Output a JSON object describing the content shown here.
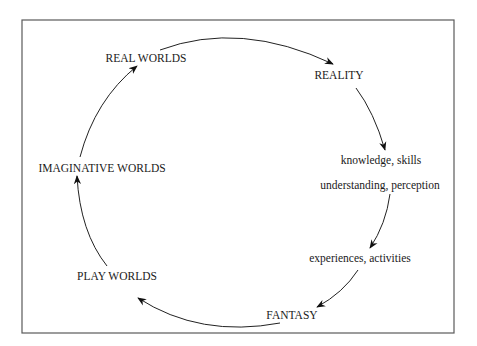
{
  "diagram": {
    "type": "cycle",
    "nodes": [
      {
        "id": "real_worlds",
        "label": "REAL WORLDS"
      },
      {
        "id": "reality",
        "label": "REALITY"
      },
      {
        "id": "knowledge",
        "label": "knowledge, skills"
      },
      {
        "id": "understanding",
        "label": "understanding, perception"
      },
      {
        "id": "experiences",
        "label": "experiences, activities"
      },
      {
        "id": "fantasy",
        "label": "FANTASY"
      },
      {
        "id": "play_worlds",
        "label": "PLAY WORLDS"
      },
      {
        "id": "imaginative_worlds",
        "label": "IMAGINATIVE WORLDS"
      }
    ],
    "edges": [
      {
        "from": "real_worlds",
        "to": "reality"
      },
      {
        "from": "reality",
        "to": "knowledge"
      },
      {
        "from": "understanding",
        "to": "experiences"
      },
      {
        "from": "experiences",
        "to": "fantasy"
      },
      {
        "from": "fantasy",
        "to": "play_worlds"
      },
      {
        "from": "play_worlds",
        "to": "imaginative_worlds"
      },
      {
        "from": "imaginative_worlds",
        "to": "real_worlds"
      }
    ],
    "colors": {
      "frame": "#5a5a5a",
      "arrow": "#222222",
      "text": "#1a1a1a"
    }
  }
}
